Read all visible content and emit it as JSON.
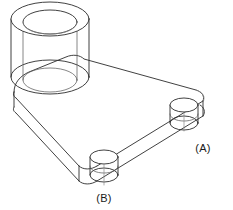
{
  "drawing": {
    "type": "isometric-technical-drawing",
    "subject": "triangular base plate with one large bored boss and two small bosses",
    "background_color": "#ffffff",
    "line_color": "#2b2b2b",
    "hidden_line_color": "#8a8a8a",
    "canvas": {
      "width": 233,
      "height": 210
    }
  },
  "callouts": [
    {
      "id": "a",
      "label": "(A)",
      "x": 203,
      "y": 148,
      "describes": "small cylindrical boss at right corner of plate"
    },
    {
      "id": "b",
      "label": "(B)",
      "x": 104,
      "y": 199,
      "describes": "small cylindrical boss at bottom corner of plate"
    }
  ],
  "features": {
    "large_boss": {
      "name": "large-bored-boss",
      "top_outer_ellipse": {
        "cx": 50,
        "cy": 19,
        "rx": 39,
        "ry": 17
      },
      "top_inner_ellipse": {
        "cx": 50,
        "cy": 22,
        "rx": 27,
        "ry": 12
      },
      "bottom_outer_ellipse": {
        "cx": 50,
        "cy": 77,
        "rx": 39,
        "ry": 17
      },
      "bottom_inner_ellipse": {
        "cx": 50,
        "cy": 80,
        "rx": 27,
        "ry": 12
      },
      "height": 58
    },
    "boss_a": {
      "name": "small-boss-a",
      "top_ellipse": {
        "cx": 184,
        "cy": 104,
        "rx": 14,
        "ry": 7
      },
      "bottom_ellipse": {
        "cx": 184,
        "cy": 122,
        "rx": 14,
        "ry": 7
      },
      "height": 18
    },
    "boss_b": {
      "name": "small-boss-b",
      "top_ellipse": {
        "cx": 104,
        "cy": 156,
        "rx": 14,
        "ry": 7
      },
      "bottom_ellipse": {
        "cx": 104,
        "cy": 174,
        "rx": 14,
        "ry": 7
      },
      "height": 18
    },
    "plate": {
      "name": "triangular-base-plate",
      "thickness": 16,
      "top_face_corners": [
        {
          "x": 14,
          "y": 92
        },
        {
          "x": 74,
          "y": 58
        },
        {
          "x": 199,
          "y": 96
        },
        {
          "x": 80,
          "y": 171
        }
      ]
    }
  }
}
